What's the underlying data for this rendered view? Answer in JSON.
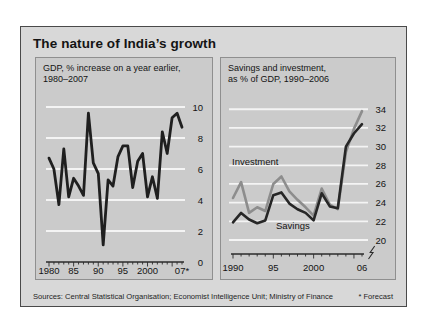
{
  "title": "The nature of India’s growth",
  "footer": {
    "sources": "Sources: Central Statistical Organisation; Economist Intelligence Unit; Ministry of Finance",
    "forecast_note": "* Forecast"
  },
  "colors": {
    "page_bg": "#ffffff",
    "box_bg": "#d8d8d8",
    "box_border": "#4a4a4a",
    "panel_bg": "#cbcbcb",
    "panel_border": "#8f8f8f",
    "gridline": "#f4f4f4",
    "axis": "#2b2b2b",
    "text": "#141414",
    "gdp_line": "#1f1f1f",
    "investment_line": "#8d8d8d",
    "savings_line": "#262626"
  },
  "chart_data": [
    {
      "type": "line",
      "title_line1": "GDP, % increase on a year earlier,",
      "title_line2": "1980–2007",
      "years": [
        1980,
        1981,
        1982,
        1983,
        1984,
        1985,
        1986,
        1987,
        1988,
        1989,
        1990,
        1991,
        1992,
        1993,
        1994,
        1995,
        1996,
        1997,
        1998,
        1999,
        2000,
        2001,
        2002,
        2003,
        2004,
        2005,
        2006,
        2007
      ],
      "series": [
        {
          "values": [
            6.7,
            6.0,
            3.7,
            7.3,
            4.2,
            5.4,
            4.9,
            4.3,
            9.6,
            6.4,
            5.7,
            1.1,
            5.3,
            4.9,
            6.8,
            7.5,
            7.5,
            4.8,
            6.5,
            7.0,
            4.2,
            5.5,
            4.1,
            8.4,
            7.0,
            9.3,
            9.6,
            8.7
          ]
        }
      ],
      "ylim": [
        0,
        10
      ],
      "yticks": [
        10,
        8,
        6,
        4,
        2,
        0
      ],
      "xticks": [
        {
          "label": "1980",
          "year": 1980
        },
        {
          "label": "85",
          "year": 1985
        },
        {
          "label": "90",
          "year": 1990
        },
        {
          "label": "95",
          "year": 1995
        },
        {
          "label": "2000",
          "year": 2000
        },
        {
          "label": "07*",
          "year": 2007
        }
      ],
      "axis_break": false,
      "grid": true,
      "legend_position": "none"
    },
    {
      "type": "line",
      "title_line1": "Savings and investment,",
      "title_line2": "as % of GDP, 1990–2006",
      "years": [
        1990,
        1991,
        1992,
        1993,
        1994,
        1995,
        1996,
        1997,
        1998,
        1999,
        2000,
        2001,
        2002,
        2003,
        2004,
        2005,
        2006
      ],
      "series": [
        {
          "name": "Investment",
          "values": [
            24.5,
            26.2,
            22.9,
            23.5,
            23.1,
            26.0,
            26.8,
            25.2,
            24.3,
            23.5,
            22.6,
            25.5,
            23.8,
            23.3,
            29.4,
            31.9,
            33.8
          ]
        },
        {
          "name": "Savings",
          "values": [
            21.9,
            22.9,
            22.2,
            21.8,
            22.1,
            24.8,
            25.1,
            23.9,
            23.3,
            22.9,
            22.1,
            25.0,
            23.6,
            23.4,
            30.0,
            31.4,
            32.4
          ]
        }
      ],
      "ylim": [
        20,
        34
      ],
      "yticks": [
        34,
        32,
        30,
        28,
        26,
        24,
        22,
        20
      ],
      "xticks": [
        {
          "label": "1990",
          "year": 1990
        },
        {
          "label": "95",
          "year": 1995
        },
        {
          "label": "2000",
          "year": 2000
        },
        {
          "label": "06",
          "year": 2006
        }
      ],
      "axis_break": true,
      "grid": true,
      "legend_position": "inline-labels"
    }
  ]
}
